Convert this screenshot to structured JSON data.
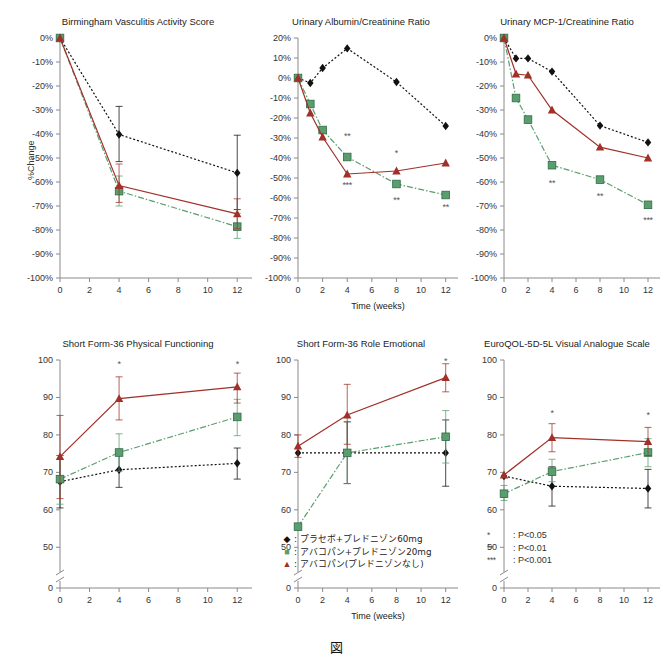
{
  "caption": "図",
  "axis": {
    "ylabel_top": "%Change",
    "xlabel": "Time (weeks)"
  },
  "legend": {
    "items": [
      {
        "marker": "diamond",
        "color": "#111111",
        "label": ": プラセボ+プレドニゾン60mg"
      },
      {
        "marker": "square",
        "color": "#5a9e6f",
        "label": ": アバコパン+プレドニゾン20mg"
      },
      {
        "marker": "triangle",
        "color": "#a03028",
        "label": ": アバコパン(プレドニゾンなし)"
      }
    ]
  },
  "sig_legend": {
    "items": [
      {
        "stars": "*",
        "text": ": P<0.05"
      },
      {
        "stars": "**",
        "text": ": P<0.01"
      },
      {
        "stars": "***",
        "text": ": P<0.001"
      }
    ]
  },
  "series_names": {
    "placebo": "プラセボ+プレドニゾン60mg",
    "ava20": "アバコパン+プレドニゾン20mg",
    "ava0": "アバコパン(プレドニゾンなし)"
  },
  "chart_data": [
    {
      "id": "bvas",
      "type": "line",
      "title": "Birmingham Vasculitis Activity Score",
      "xlabel": "",
      "ylabel": "%Change",
      "x": [
        0,
        4,
        12
      ],
      "xticks": [
        0,
        2,
        4,
        6,
        8,
        10,
        12
      ],
      "xticklabels": [
        "0",
        "2",
        "4",
        "6",
        "8",
        "10",
        "12"
      ],
      "xlim": [
        0,
        13
      ],
      "ylim": [
        -100,
        0
      ],
      "yticks": [
        0,
        -10,
        -20,
        -30,
        -40,
        -50,
        -60,
        -70,
        -80,
        -90,
        -100
      ],
      "yticklabels": [
        "0%",
        "-10%",
        "-20%",
        "-30%",
        "-40%",
        "-50%",
        "-60%",
        "-70%",
        "-80%",
        "-90%",
        "-100%"
      ],
      "grid": false,
      "series": [
        {
          "name": "プラセボ+プレドニゾン60mg",
          "color": "#111111",
          "marker": "diamond",
          "dash": "dotted",
          "x": [
            0,
            4,
            12
          ],
          "values": [
            0,
            -40.2,
            -56.2
          ],
          "err_low": [
            0,
            -51.5,
            -71.5
          ],
          "err_high": [
            0,
            -28.5,
            -40.5
          ]
        },
        {
          "name": "アバコパン+プレドニゾン20mg",
          "color": "#5a9e6f",
          "marker": "square",
          "dash": "dashdot",
          "x": [
            0,
            4,
            12
          ],
          "values": [
            0,
            -63.8,
            -78.6
          ],
          "err_low": [
            0,
            -70.0,
            -83.5
          ],
          "err_high": [
            0,
            -57.5,
            -73.0
          ]
        },
        {
          "name": "アバコパン(プレドニゾンなし)",
          "color": "#a03028",
          "marker": "triangle",
          "dash": "solid",
          "x": [
            0,
            4,
            12
          ],
          "values": [
            0,
            -61.5,
            -73.3
          ],
          "err_low": [
            0,
            -68.5,
            -79.5
          ],
          "err_high": [
            0,
            -52.5,
            -67.0
          ]
        }
      ],
      "annotations": []
    },
    {
      "id": "uacr",
      "type": "line",
      "title": "Urinary Albumin/Creatinine Ratio",
      "xlabel": "Time (weeks)",
      "ylabel": "",
      "x": [
        0,
        1,
        2,
        4,
        8,
        12
      ],
      "xticks": [
        0,
        2,
        4,
        6,
        8,
        10,
        12
      ],
      "xticklabels": [
        "0",
        "2",
        "4",
        "6",
        "8",
        "10",
        "12"
      ],
      "xlim": [
        0,
        13
      ],
      "ylim": [
        -100,
        20
      ],
      "yticks": [
        20,
        10,
        0,
        -10,
        -20,
        -30,
        -40,
        -50,
        -60,
        -70,
        -80,
        -90,
        -100
      ],
      "yticklabels": [
        "20%",
        "10%",
        "0%",
        "-10%",
        "-20%",
        "-30%",
        "-40%",
        "-50%",
        "-60%",
        "-70%",
        "-80%",
        "-90%",
        "-100%"
      ],
      "grid": false,
      "series": [
        {
          "name": "プラセボ+プレドニゾン60mg",
          "color": "#111111",
          "marker": "diamond",
          "dash": "dotted",
          "x": [
            0,
            1,
            2,
            4,
            8,
            12
          ],
          "values": [
            0,
            -2.5,
            5.0,
            14.8,
            -2.0,
            -24.0
          ]
        },
        {
          "name": "アバコパン+プレドニゾン20mg",
          "color": "#5a9e6f",
          "marker": "square",
          "dash": "dashdot",
          "x": [
            0,
            1,
            2,
            4,
            8,
            12
          ],
          "values": [
            0,
            -13.0,
            -26.0,
            -39.5,
            -53.0,
            -58.5
          ]
        },
        {
          "name": "アバコパン(プレドニゾンなし)",
          "color": "#a03028",
          "marker": "triangle",
          "dash": "solid",
          "x": [
            0,
            1,
            2,
            4,
            8,
            12
          ],
          "values": [
            0,
            -17.5,
            -29.5,
            -48.0,
            -46.5,
            -42.5
          ]
        }
      ],
      "annotations": [
        {
          "stars": "**",
          "x": 4,
          "y": -30.5
        },
        {
          "stars": "***",
          "x": 4,
          "y": -55.0
        },
        {
          "stars": "*",
          "x": 8,
          "y": -39.0
        },
        {
          "stars": "**",
          "x": 8,
          "y": -62.5
        },
        {
          "stars": "**",
          "x": 12,
          "y": -66.0
        }
      ]
    },
    {
      "id": "umcp1",
      "type": "line",
      "title": "Urinary MCP-1/Creatinine Ratio",
      "xlabel": "",
      "ylabel": "",
      "x": [
        0,
        1,
        2,
        4,
        8,
        12
      ],
      "xticks": [
        0,
        2,
        4,
        6,
        8,
        10,
        12
      ],
      "xticklabels": [
        "0",
        "2",
        "4",
        "6",
        "8",
        "10",
        "12"
      ],
      "xlim": [
        0,
        13
      ],
      "ylim": [
        -100,
        0
      ],
      "yticks": [
        0,
        -10,
        -20,
        -30,
        -40,
        -50,
        -60,
        -70,
        -80,
        -90,
        -100
      ],
      "yticklabels": [
        "0%",
        "-10%",
        "-20%",
        "-30%",
        "-40%",
        "-50%",
        "-60%",
        "-70%",
        "-80%",
        "-90%",
        "-100%"
      ],
      "grid": false,
      "series": [
        {
          "name": "プラセボ+プレドニゾン60mg",
          "color": "#111111",
          "marker": "diamond",
          "dash": "dotted",
          "x": [
            0,
            1,
            2,
            4,
            8,
            12
          ],
          "values": [
            0,
            -8.5,
            -8.5,
            -14.0,
            -36.5,
            -43.5
          ]
        },
        {
          "name": "アバコパン+プレドニゾン20mg",
          "color": "#5a9e6f",
          "marker": "square",
          "dash": "dashdot",
          "x": [
            0,
            1,
            2,
            4,
            8,
            12
          ],
          "values": [
            0,
            -25.0,
            -34.0,
            -53.0,
            -59.0,
            -69.5
          ]
        },
        {
          "name": "アバコパン(プレドニゾンなし)",
          "color": "#a03028",
          "marker": "triangle",
          "dash": "solid",
          "x": [
            0,
            1,
            2,
            4,
            8,
            12
          ],
          "values": [
            0,
            -15.0,
            -15.5,
            -30.0,
            -45.5,
            -50.0
          ]
        }
      ],
      "annotations": [
        {
          "stars": "**",
          "x": 4,
          "y": -61.5
        },
        {
          "stars": "**",
          "x": 8,
          "y": -67.0
        },
        {
          "stars": "***",
          "x": 12,
          "y": -77.0
        }
      ]
    },
    {
      "id": "sf36pf",
      "type": "line",
      "title": "Short Form-36 Physical Functioning",
      "xlabel": "",
      "ylabel": "",
      "x": [
        0,
        4,
        12
      ],
      "xticks": [
        0,
        2,
        4,
        6,
        8,
        10,
        12
      ],
      "xticklabels": [
        "0",
        "2",
        "4",
        "6",
        "8",
        "10",
        "12"
      ],
      "xlim": [
        0,
        13
      ],
      "ylim": [
        45,
        100
      ],
      "yticks": [
        100,
        90,
        80,
        70,
        60,
        50,
        0
      ],
      "yticklabels": [
        "100",
        "90",
        "80",
        "70",
        "60",
        "50",
        "0"
      ],
      "axis_break": true,
      "grid": false,
      "series": [
        {
          "name": "プラセボ+プレドニゾン60mg",
          "color": "#111111",
          "marker": "diamond",
          "dash": "dotted",
          "x": [
            0,
            4,
            12
          ],
          "values": [
            67.5,
            70.7,
            72.4
          ],
          "err_low": [
            60.5,
            66.0,
            68.2
          ],
          "err_high": [
            74.5,
            75.5,
            76.5
          ]
        },
        {
          "name": "アバコパン+プレドニゾン20mg",
          "color": "#5a9e6f",
          "marker": "square",
          "dash": "dashdot",
          "x": [
            0,
            4,
            12
          ],
          "values": [
            68.2,
            75.3,
            84.8
          ],
          "err_low": [
            61.5,
            70.3,
            79.8
          ],
          "err_high": [
            74.5,
            80.3,
            89.5
          ]
        },
        {
          "name": "アバコパン(プレドニゾンなし)",
          "color": "#a03028",
          "marker": "triangle",
          "dash": "solid",
          "x": [
            0,
            4,
            12
          ],
          "values": [
            74.2,
            89.7,
            92.8
          ],
          "err_low": [
            63.0,
            84.0,
            88.5
          ],
          "err_high": [
            85.2,
            95.5,
            96.5
          ]
        }
      ],
      "annotations": [
        {
          "stars": "*",
          "x": 4,
          "y": 98.0
        },
        {
          "stars": "*",
          "x": 12,
          "y": 98.0
        }
      ]
    },
    {
      "id": "sf36re",
      "type": "line",
      "title": "Short Form-36 Role Emotional",
      "xlabel": "Time (weeks)",
      "ylabel": "",
      "x": [
        0,
        4,
        12
      ],
      "xticks": [
        0,
        2,
        4,
        6,
        8,
        10,
        12
      ],
      "xticklabels": [
        "0",
        "2",
        "4",
        "6",
        "8",
        "10",
        "12"
      ],
      "xlim": [
        0,
        13
      ],
      "ylim": [
        45,
        100
      ],
      "yticks": [
        100,
        90,
        80,
        70,
        60,
        50,
        0
      ],
      "yticklabels": [
        "100",
        "90",
        "80",
        "70",
        "60",
        "50",
        "0"
      ],
      "axis_break": true,
      "grid": false,
      "series": [
        {
          "name": "プラセボ+プレドニゾン60mg",
          "color": "#111111",
          "marker": "diamond",
          "dash": "dotted",
          "x": [
            0,
            4,
            12
          ],
          "values": [
            75.2,
            75.2,
            75.2
          ],
          "err_low": [
            75.2,
            67.0,
            66.3
          ],
          "err_high": [
            75.2,
            83.5,
            84.0
          ]
        },
        {
          "name": "アバコパン+プレドニゾン20mg",
          "color": "#5a9e6f",
          "marker": "square",
          "dash": "dashdot",
          "x": [
            0,
            4,
            12
          ],
          "values": [
            55.5,
            75.2,
            79.5
          ],
          "err_low": [
            55.5,
            67.0,
            72.5
          ],
          "err_high": [
            55.5,
            83.5,
            86.5
          ]
        },
        {
          "name": "アバコパン(プレドニゾンなし)",
          "color": "#a03028",
          "marker": "triangle",
          "dash": "solid",
          "x": [
            0,
            4,
            12
          ],
          "values": [
            77.0,
            85.3,
            95.3
          ],
          "err_low": [
            74.0,
            77.5,
            91.5
          ],
          "err_high": [
            80.0,
            93.5,
            99.0
          ]
        }
      ],
      "annotations": [
        {
          "stars": "*",
          "x": 12,
          "y": 99.0
        }
      ]
    },
    {
      "id": "eq5d",
      "type": "line",
      "title": "EuroQOL-5D-5L Visual Analogue Scale",
      "xlabel": "",
      "ylabel": "",
      "x": [
        0,
        4,
        12
      ],
      "xticks": [
        0,
        2,
        4,
        6,
        8,
        10,
        12
      ],
      "xticklabels": [
        "0",
        "2",
        "4",
        "6",
        "8",
        "10",
        "12"
      ],
      "xlim": [
        0,
        13
      ],
      "ylim": [
        45,
        100
      ],
      "yticks": [
        100,
        90,
        80,
        70,
        60,
        50,
        0
      ],
      "yticklabels": [
        "100",
        "90",
        "80",
        "70",
        "60",
        "50",
        "0"
      ],
      "axis_break": true,
      "grid": false,
      "series": [
        {
          "name": "プラセボ+プレドニゾン60mg",
          "color": "#111111",
          "marker": "diamond",
          "dash": "dotted",
          "x": [
            0,
            4,
            12
          ],
          "values": [
            69.0,
            66.3,
            65.7
          ],
          "err_low": [
            69.0,
            61.0,
            60.5
          ],
          "err_high": [
            69.0,
            71.5,
            70.8
          ]
        },
        {
          "name": "アバコパン+プレドニゾン20mg",
          "color": "#5a9e6f",
          "marker": "square",
          "dash": "dashdot",
          "x": [
            0,
            4,
            12
          ],
          "values": [
            64.3,
            70.2,
            75.3
          ],
          "err_low": [
            62.5,
            67.5,
            71.5
          ],
          "err_high": [
            66.5,
            73.5,
            79.0
          ]
        },
        {
          "name": "アバコパン(プレドニゾンなし)",
          "color": "#a03028",
          "marker": "triangle",
          "dash": "solid",
          "x": [
            0,
            4,
            12
          ],
          "values": [
            69.3,
            79.3,
            78.2
          ],
          "err_low": [
            69.3,
            75.5,
            74.5
          ],
          "err_high": [
            69.3,
            83.0,
            82.0
          ]
        }
      ],
      "annotations": [
        {
          "stars": "*",
          "x": 4,
          "y": 85.0
        },
        {
          "stars": "*",
          "x": 12,
          "y": 84.5
        }
      ]
    }
  ]
}
